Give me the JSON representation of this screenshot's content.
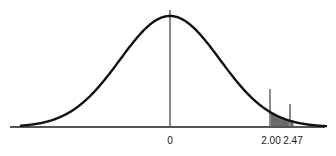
{
  "figure": {
    "width": 336,
    "height": 156,
    "background": "#ffffff"
  },
  "chart_data": {
    "type": "area",
    "title": "",
    "subtitle": "",
    "xlabel": "",
    "ylabel": "",
    "distribution": {
      "name": "standard normal",
      "mean": 0,
      "sd": 1,
      "peak_z": 0
    },
    "xlim": [
      -3.2,
      3.1
    ],
    "ylim": [
      0,
      0.4
    ],
    "grid": false,
    "legend": null,
    "axis": {
      "visible": true,
      "color": "#555555",
      "width_px": 2,
      "y_px": 127,
      "x_start_px": 10,
      "x_end_px": 325
    },
    "curve": {
      "color": "#111111",
      "width_px": 2.4,
      "fill": "none"
    },
    "tick_labels": [
      "0",
      "2.00",
      "2.47"
    ],
    "ticks": [
      {
        "label": "0",
        "z": 0,
        "x_px": 170,
        "line_top_px": 10,
        "line_bottom_px": 127,
        "line_color": "#8a8a8a",
        "line_width_px": 2,
        "label_x_px": 170,
        "label_y_px": 136
      },
      {
        "label": "2.00",
        "z": 2.0,
        "x_px": 270,
        "line_top_px": 89,
        "line_bottom_px": 127,
        "line_color": "#8a8a8a",
        "line_width_px": 2,
        "label_x_px": 271,
        "label_y_px": 136
      },
      {
        "label": "2.47",
        "z": 2.47,
        "x_px": 290,
        "line_top_px": 104,
        "line_bottom_px": 127,
        "line_color": "#8a8a8a",
        "line_width_px": 2,
        "label_x_px": 293,
        "label_y_px": 136
      }
    ],
    "shaded_region": {
      "from_z": 2.0,
      "to_z": 2.47,
      "color": "#6b6b6b",
      "opacity": 1,
      "from_x_px": 270,
      "to_x_px": 290
    },
    "geometry": {
      "baseline_y_px": 127,
      "peak_y_px": 16,
      "peak_x_px": 170,
      "px_per_z": 50,
      "curve_start_x_px": 21,
      "curve_end_x_px": 326
    },
    "series": [
      {
        "name": "standard normal density",
        "x": [
          -3.0,
          -2.75,
          -2.5,
          -2.25,
          -2.0,
          -1.75,
          -1.5,
          -1.25,
          -1.0,
          -0.75,
          -0.5,
          -0.25,
          0.0,
          0.25,
          0.5,
          0.75,
          1.0,
          1.25,
          1.5,
          1.75,
          2.0,
          2.25,
          2.47,
          2.5,
          2.75,
          3.0
        ],
        "values": [
          0.004,
          0.009,
          0.018,
          0.032,
          0.054,
          0.086,
          0.13,
          0.183,
          0.242,
          0.301,
          0.352,
          0.387,
          0.399,
          0.387,
          0.352,
          0.301,
          0.242,
          0.183,
          0.13,
          0.086,
          0.054,
          0.032,
          0.019,
          0.018,
          0.009,
          0.004
        ]
      }
    ]
  }
}
